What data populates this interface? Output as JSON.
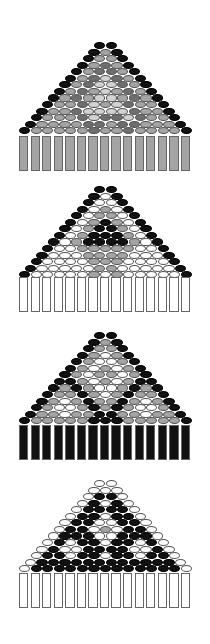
{
  "colors": {
    "K": "#111111",
    "D": "#6e6e6e",
    "M": "#a4a4a4",
    "L": "#d2d2d2",
    "W": "#ffffff"
  },
  "geometry": {
    "bead_pitch_x": 11.55,
    "row_pitch_y": 6.55,
    "bead_w": 11.2,
    "bead_h": 7.2,
    "center_x": 105.5,
    "fringe_left": 19,
    "fringe_count": 15,
    "fringe_w": 9.4,
    "fringe_h": 35
  },
  "panels": [
    {
      "name": "pattern-1-gray",
      "top_y": 42,
      "fringe_y": 136,
      "fringe_color": "M",
      "rows": [
        "KK",
        "KMK",
        "KMMK",
        "KMDMK",
        "KMDDMK",
        "KMDLDMK",
        "KMDLLDMK",
        "KMDMLMDMK",
        "KMDMLLMDMK",
        "KMMDLMLDMMK",
        "KMMDLLLLDMMK",
        "KMMMDLDDLDMMK",
        "KMMMMDDMDDMMMK",
        "KMMMMMDMMDMMMMK"
      ]
    },
    {
      "name": "pattern-2-black-triangle",
      "top_y": 186,
      "fringe_y": 277,
      "fringe_color": "W",
      "rows": [
        "KK",
        "KWK",
        "KWWK",
        "KWMWK",
        "KWMMWK",
        "KWMKMWK",
        "KWMKKMWK",
        "KWMKKKMWK",
        "KWMKKKKMWK",
        "KWWMMMMMWWK",
        "KWWWMMMMWWWK",
        "KWWWWMMMWWWWK",
        "KWWWWWMMWWWWWK",
        "KWWWWWMWMWWWWWK"
      ]
    },
    {
      "name": "pattern-3-black-fringe",
      "top_y": 332,
      "fringe_y": 425,
      "fringe_color": "K",
      "rows": [
        "KK",
        "KMK",
        "KMMK",
        "KMWMK",
        "KMWWMK",
        "KMWMWMK",
        "KMWMMWMK",
        "KKMWMWMKK",
        "KMKMWWMKMK",
        "KMMKMWMKMMK",
        "KMWMKMMKMWMK",
        "KMWWMKMKMWWMK",
        "KMMWMMKKMMWMMK",
        "KMMMMMKKKMMMMMK"
      ]
    },
    {
      "name": "pattern-4-white-edge",
      "top_y": 480,
      "fringe_y": 573,
      "fringe_color": "W",
      "rows": [
        "WW",
        "WWW",
        "WKKW",
        "WKWKW",
        "WKKKKW",
        "WKKWKKW",
        "WKKWWKKW",
        "WKKWMWKKW",
        "WKKKWWKKKW",
        "WKWKKWKKWKW",
        "WKWWKKKKWWKW",
        "WKKWKKWKKWKKW",
        "WKKKKKKKKKKKKW",
        "WKKKKKKKKKKKKKW"
      ]
    }
  ]
}
